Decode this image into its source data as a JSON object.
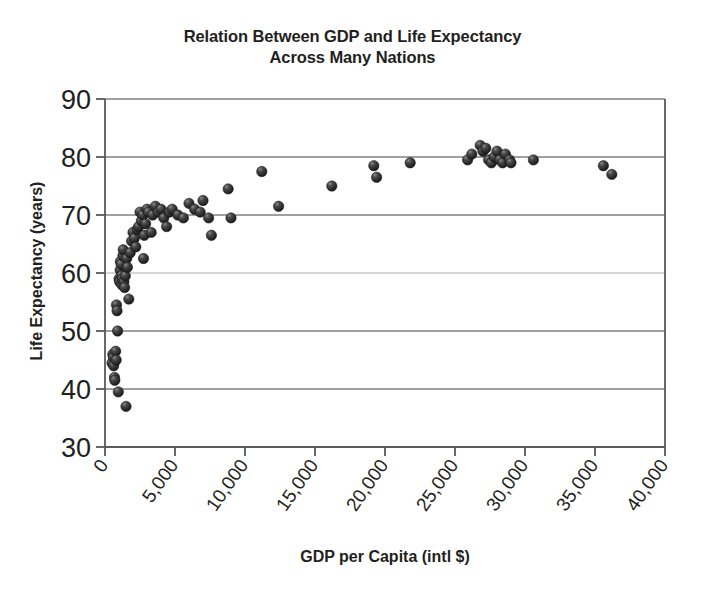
{
  "chart_data": {
    "type": "scatter",
    "title": "Relation Between GDP and Life Expectancy Across Many Nations",
    "title_line1": "Relation Between GDP and Life Expectancy",
    "title_line2": "Across Many Nations",
    "xlabel": "GDP per Capita (intl $)",
    "ylabel": "Life Expectancy (years)",
    "xlim": [
      0,
      40000
    ],
    "ylim": [
      30,
      90
    ],
    "xticks": [
      0,
      5000,
      10000,
      15000,
      20000,
      25000,
      30000,
      35000,
      40000
    ],
    "xtick_labels": [
      "0",
      "5,000",
      "10,000",
      "15,000",
      "20,000",
      "25,000",
      "30,000",
      "35,000",
      "40,000"
    ],
    "yticks": [
      30,
      40,
      50,
      60,
      70,
      80,
      90
    ],
    "ytick_labels": [
      "30",
      "40",
      "50",
      "60",
      "70",
      "80",
      "90"
    ],
    "grid": "horizontal",
    "legend": "none",
    "marker_color": "#2b2b2b",
    "gridline_color": "#808080",
    "axis_color": "#58595b",
    "series": [
      {
        "name": "Nations",
        "points": [
          [
            500,
            44.5
          ],
          [
            560,
            46.0
          ],
          [
            600,
            45.5
          ],
          [
            620,
            44.0
          ],
          [
            680,
            42.0
          ],
          [
            700,
            41.5
          ],
          [
            760,
            46.5
          ],
          [
            800,
            45.0
          ],
          [
            820,
            54.5
          ],
          [
            860,
            53.5
          ],
          [
            900,
            50.0
          ],
          [
            950,
            39.5
          ],
          [
            1000,
            59.0
          ],
          [
            1040,
            58.5
          ],
          [
            1080,
            60.5
          ],
          [
            1100,
            62.0
          ],
          [
            1150,
            61.5
          ],
          [
            1180,
            59.5
          ],
          [
            1200,
            58.0
          ],
          [
            1240,
            59.0
          ],
          [
            1280,
            63.0
          ],
          [
            1300,
            64.0
          ],
          [
            1350,
            58.5
          ],
          [
            1400,
            57.5
          ],
          [
            1450,
            59.5
          ],
          [
            1500,
            37.0
          ],
          [
            1550,
            62.5
          ],
          [
            1600,
            61.0
          ],
          [
            1700,
            55.5
          ],
          [
            1800,
            63.5
          ],
          [
            1900,
            65.5
          ],
          [
            2000,
            67.0
          ],
          [
            2100,
            66.0
          ],
          [
            2200,
            64.5
          ],
          [
            2300,
            67.5
          ],
          [
            2400,
            68.0
          ],
          [
            2500,
            70.5
          ],
          [
            2600,
            69.0
          ],
          [
            2700,
            70.0
          ],
          [
            2750,
            62.5
          ],
          [
            2800,
            66.5
          ],
          [
            2900,
            68.5
          ],
          [
            3000,
            71.0
          ],
          [
            3100,
            70.5
          ],
          [
            3300,
            67.0
          ],
          [
            3400,
            70.0
          ],
          [
            3600,
            71.5
          ],
          [
            3800,
            70.5
          ],
          [
            4000,
            71.0
          ],
          [
            4200,
            69.5
          ],
          [
            4400,
            68.0
          ],
          [
            4600,
            70.5
          ],
          [
            4800,
            71.0
          ],
          [
            5200,
            70.0
          ],
          [
            5600,
            69.5
          ],
          [
            6000,
            72.0
          ],
          [
            6400,
            71.0
          ],
          [
            6800,
            70.5
          ],
          [
            7000,
            72.5
          ],
          [
            7400,
            69.5
          ],
          [
            7600,
            66.5
          ],
          [
            8800,
            74.5
          ],
          [
            9000,
            69.5
          ],
          [
            11200,
            77.5
          ],
          [
            12400,
            71.5
          ],
          [
            16200,
            75.0
          ],
          [
            19200,
            78.5
          ],
          [
            19400,
            76.5
          ],
          [
            21800,
            79.0
          ],
          [
            25900,
            79.5
          ],
          [
            26200,
            80.5
          ],
          [
            26800,
            82.0
          ],
          [
            27000,
            81.0
          ],
          [
            27200,
            81.5
          ],
          [
            27400,
            79.5
          ],
          [
            27600,
            79.0
          ],
          [
            27800,
            80.0
          ],
          [
            28000,
            81.0
          ],
          [
            28200,
            79.5
          ],
          [
            28400,
            79.0
          ],
          [
            28600,
            80.5
          ],
          [
            28900,
            79.5
          ],
          [
            29000,
            79.0
          ],
          [
            30600,
            79.5
          ],
          [
            35600,
            78.5
          ],
          [
            36200,
            77.0
          ]
        ]
      }
    ]
  }
}
